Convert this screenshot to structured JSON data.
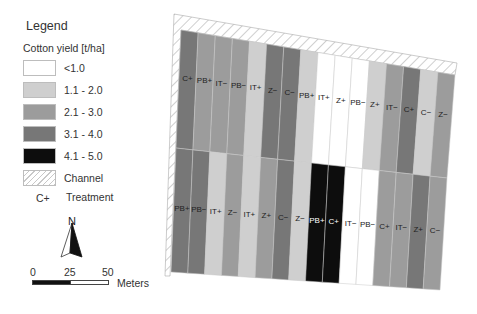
{
  "legend": {
    "title": "Legend",
    "subtitle": "Cotton yield [t/ha]",
    "classes": [
      {
        "label": "<1.0",
        "color": "#ffffff"
      },
      {
        "label": "1.1 - 2.0",
        "color": "#cfcfcf"
      },
      {
        "label": "2.1 - 3.0",
        "color": "#9c9c9c"
      },
      {
        "label": "3.1 - 4.0",
        "color": "#777777"
      },
      {
        "label": "4.1 - 5.0",
        "color": "#0d0d0d"
      }
    ],
    "channel_label": "Channel",
    "treatment_sample": "C+",
    "treatment_label": "Treatment"
  },
  "north_arrow": {
    "letter": "N"
  },
  "scale_bar": {
    "ticks": [
      "0",
      "25",
      "50"
    ],
    "units": "Meters"
  },
  "map": {
    "top_row_treatments": [
      "C+",
      "PB+",
      "IT−",
      "PB−",
      "IT+",
      "Z−",
      "C−",
      "PB+",
      "IT+",
      "Z+",
      "PB−",
      "Z+",
      "IT−",
      "C+",
      "C−",
      "Z−"
    ],
    "top_row_yield_class": [
      "3.1 - 4.0",
      "2.1 - 3.0",
      "2.1 - 3.0",
      "2.1 - 3.0",
      "1.1 - 2.0",
      "3.1 - 4.0",
      "3.1 - 4.0",
      "1.1 - 2.0",
      "<1.0",
      "<1.0",
      "<1.0",
      "1.1 - 2.0",
      "2.1 - 3.0",
      "3.1 - 4.0",
      "1.1 - 2.0",
      "2.1 - 3.0"
    ],
    "bottom_row_treatments": [
      "PB+",
      "PB−",
      "IT+",
      "Z−",
      "IT+",
      "Z+",
      "C−",
      "Z−",
      "PB+",
      "C+",
      "IT−",
      "PB−",
      "C+",
      "IT−",
      "Z+",
      "C−"
    ],
    "bottom_row_yield_class": [
      "3.1 - 4.0",
      "3.1 - 4.0",
      "1.1 - 2.0",
      "2.1 - 3.0",
      "1.1 - 2.0",
      "2.1 - 3.0",
      "3.1 - 4.0",
      "1.1 - 2.0",
      "4.1 - 5.0",
      "4.1 - 5.0",
      "<1.0",
      "<1.0",
      "2.1 - 3.0",
      "2.1 - 3.0",
      "3.1 - 4.0",
      "2.1 - 3.0"
    ]
  }
}
